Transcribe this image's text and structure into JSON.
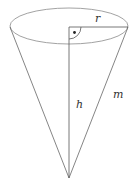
{
  "diagram": {
    "type": "cone",
    "labels": {
      "radius": "r",
      "height": "h",
      "slant": "m"
    },
    "right_angle_marker": true,
    "colors": {
      "line": "#555555",
      "ellipse": "#8a8a8a",
      "text": "#333333",
      "background": "#ffffff"
    }
  }
}
